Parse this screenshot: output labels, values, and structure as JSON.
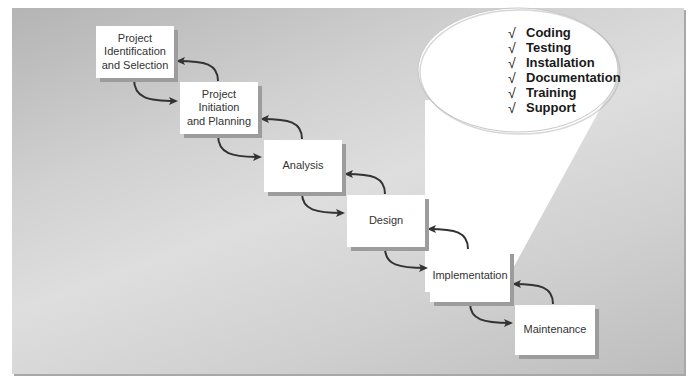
{
  "diagram": {
    "type": "waterfall-sdlc",
    "phases": [
      {
        "id": "identification",
        "label": "Project\nIdentification\nand Selection",
        "x": 96,
        "y": 26,
        "w": 78,
        "h": 52
      },
      {
        "id": "initiation",
        "label": "Project\nInitiation\nand Planning",
        "x": 180,
        "y": 82,
        "w": 78,
        "h": 52
      },
      {
        "id": "analysis",
        "label": "Analysis",
        "x": 264,
        "y": 140,
        "w": 78,
        "h": 52
      },
      {
        "id": "design",
        "label": "Design",
        "x": 347,
        "y": 195,
        "w": 78,
        "h": 52
      },
      {
        "id": "implementation",
        "label": "Implementation",
        "x": 430,
        "y": 250,
        "w": 80,
        "h": 52
      },
      {
        "id": "maintenance",
        "label": "Maintenance",
        "x": 515,
        "y": 305,
        "w": 80,
        "h": 50
      }
    ],
    "callout": {
      "attached_to": "implementation",
      "items": [
        {
          "check": "√",
          "label": "Coding"
        },
        {
          "check": "√",
          "label": "Testing"
        },
        {
          "check": "√",
          "label": "Installation"
        },
        {
          "check": "√",
          "label": "Documentation"
        },
        {
          "check": "√",
          "label": "Training"
        },
        {
          "check": "√",
          "label": "Support"
        }
      ]
    },
    "colors": {
      "background_panel": "#c8c8c8",
      "box_fill": "#ffffff",
      "box_shadow": "#9c9c9c",
      "arrow": "#333333",
      "callout_fill": "#ffffff",
      "text": "#333333"
    }
  }
}
